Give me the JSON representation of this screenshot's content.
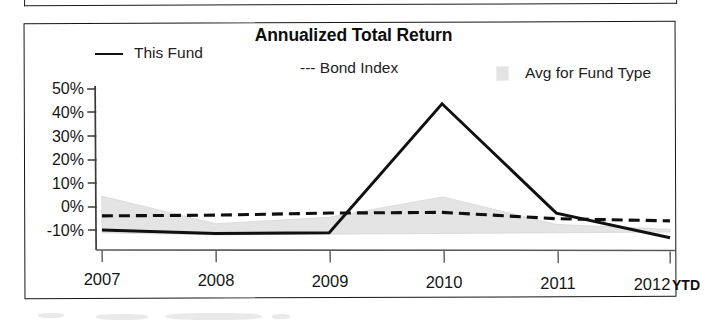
{
  "panel": {
    "title": "Annualized Total Return",
    "frame_color": "#151515",
    "background": "#ffffff"
  },
  "legend": {
    "position": "top",
    "items": [
      {
        "label": "This Fund",
        "marker": "solid-line-swatch",
        "style": "solid",
        "color": "#111111"
      },
      {
        "label": "--- Bond Index",
        "marker": "dashed-line-swatch",
        "style": "dashed",
        "color": "#111111"
      },
      {
        "label": "Avg for Fund Type",
        "marker": "gray-band-swatch",
        "style": "band",
        "color": "#e3e3e3"
      }
    ]
  },
  "axes": {
    "y_ticks": [
      "50%",
      "40%",
      "30%",
      "20%",
      "10%",
      "0%",
      "-10%"
    ],
    "x_ticks": [
      "2007",
      "2008",
      "2009",
      "2010",
      "2011",
      "2012"
    ],
    "x_suffix": "YTD"
  },
  "chart_data": {
    "type": "line",
    "title": "Annualized Total Return",
    "xlabel": "",
    "ylabel": "",
    "x": [
      "2007",
      "2008",
      "2009",
      "2010",
      "2011",
      "2012"
    ],
    "categories": [
      "2007",
      "2008",
      "2009",
      "2010",
      "2011",
      "2012"
    ],
    "ylim": [
      -10,
      50
    ],
    "ytick_values": [
      50,
      40,
      30,
      20,
      10,
      0,
      -10
    ],
    "ytick_labels": [
      "50%",
      "40%",
      "30%",
      "20%",
      "10%",
      "0%",
      "-10%"
    ],
    "xtick_labels": [
      "2007",
      "2008",
      "2009",
      "2010",
      "2011",
      "2012"
    ],
    "x_axis_note": "YTD",
    "grid": false,
    "legend_position": "top",
    "units": "percent",
    "series": [
      {
        "name": "This Fund",
        "style": "solid",
        "color": "#111111",
        "values": [
          0,
          -1.5,
          -1.5,
          44,
          5,
          -4
        ]
      },
      {
        "name": "Bond Index",
        "style": "dashed",
        "color": "#111111",
        "values": [
          5,
          5,
          5.5,
          5.5,
          3,
          2
        ]
      },
      {
        "name": "Avg for Fund Type",
        "style": "band",
        "color": "#e3e3e3",
        "upper": [
          12,
          2,
          4,
          11,
          1,
          -1
        ],
        "lower": [
          -1,
          -2,
          -2,
          -2,
          -2,
          -2
        ]
      }
    ]
  }
}
